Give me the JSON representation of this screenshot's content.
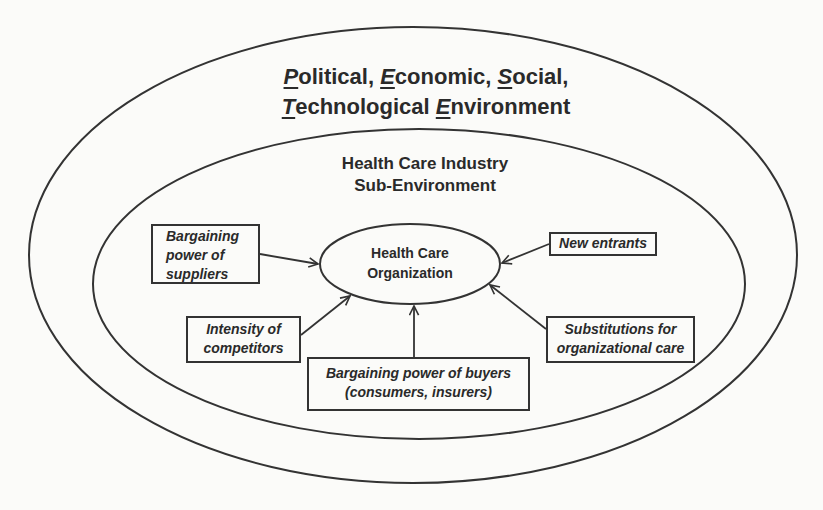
{
  "diagram": {
    "outer_environment": {
      "title_line1": [
        {
          "letter": "P",
          "rest": "olitical, "
        },
        {
          "letter": "E",
          "rest": "conomic, "
        },
        {
          "letter": "S",
          "rest": "ocial,"
        }
      ],
      "title_line2": [
        {
          "letter": "T",
          "rest": "echnological "
        },
        {
          "letter": "E",
          "rest": "nvironment"
        }
      ],
      "full_title": "Political, Economic, Social, Technological Environment"
    },
    "industry_environment": {
      "title_line1": "Health Care Industry",
      "title_line2": "Sub-Environment"
    },
    "center": {
      "line1": "Health Care",
      "line2": "Organization"
    },
    "forces": {
      "suppliers": {
        "lines": [
          "Bargaining",
          "power of",
          "suppliers"
        ]
      },
      "new_entrants": {
        "lines": [
          "New entrants"
        ]
      },
      "competitors": {
        "lines": [
          "Intensity of",
          "competitors"
        ]
      },
      "buyers": {
        "lines": [
          "Bargaining power of buyers",
          "(consumers, insurers)"
        ]
      },
      "substitutions": {
        "lines": [
          "Substitutions for",
          "organizational care"
        ]
      }
    },
    "colors": {
      "ink": "#333333",
      "text": "#2a2a2a",
      "paper": "#fbfbf9"
    }
  }
}
